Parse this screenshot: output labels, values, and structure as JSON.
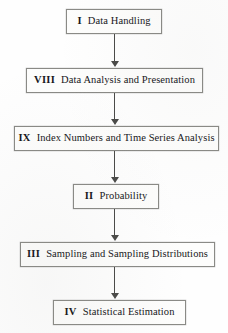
{
  "diagram": {
    "type": "flowchart",
    "orientation": "vertical-top-to-bottom",
    "background_color": "#fefefe",
    "box_border_color": "#8a8a86",
    "arrow_color": "#4a4a48",
    "text_color": "#16161a",
    "nodes": [
      {
        "id": "node-1",
        "number": "I",
        "label": "Data Handling",
        "full_text": "I   Data Handling"
      },
      {
        "id": "node-2",
        "number": "VIII",
        "label": "Data Analysis and Presentation",
        "full_text": "VIII   Data Analysis and Presentation"
      },
      {
        "id": "node-3",
        "number": "IX",
        "label": "Index Numbers and Time Series Analysis",
        "full_text": "IX   Index Numbers and Time Series Analysis"
      },
      {
        "id": "node-4",
        "number": "II",
        "label": "Probability",
        "full_text": "II   Probability"
      },
      {
        "id": "node-5",
        "number": "III",
        "label": "Sampling and Sampling Distributions",
        "full_text": "III   Sampling and Sampling Distributions"
      },
      {
        "id": "node-6",
        "number": "IV",
        "label": "Statistical Estimation",
        "full_text": "IV   Statistical Estimation"
      }
    ],
    "connectors": [
      {
        "id": "conn-1",
        "from": "node-1",
        "to": "node-2",
        "icon": "down-arrow-icon"
      },
      {
        "id": "conn-2",
        "from": "node-2",
        "to": "node-3",
        "icon": "down-arrow-icon"
      },
      {
        "id": "conn-3",
        "from": "node-3",
        "to": "node-4",
        "icon": "down-arrow-icon"
      },
      {
        "id": "conn-4",
        "from": "node-4",
        "to": "node-5",
        "icon": "down-arrow-icon"
      },
      {
        "id": "conn-5",
        "from": "node-5",
        "to": "node-6",
        "icon": "down-arrow-icon"
      }
    ]
  }
}
